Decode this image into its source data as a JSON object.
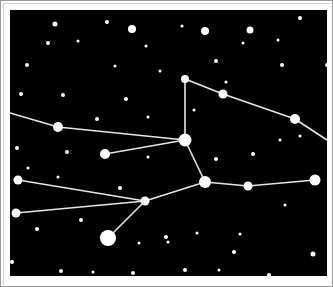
{
  "image": {
    "subject": "constellation star map",
    "background_color": "#000000",
    "frame_color": "#ffffff",
    "border_color": "#9a9a9a",
    "star_color": "#ffffff",
    "line_color": "#e6e6e6"
  },
  "constellation": {
    "stars": [
      {
        "id": "A",
        "x": 185,
        "y": 79,
        "r": 4
      },
      {
        "id": "B",
        "x": 223,
        "y": 94,
        "r": 4.5
      },
      {
        "id": "C",
        "x": 295,
        "y": 119,
        "r": 5
      },
      {
        "id": "D",
        "x": 185,
        "y": 140,
        "r": 6.5
      },
      {
        "id": "E",
        "x": 58,
        "y": 127,
        "r": 5
      },
      {
        "id": "F",
        "x": 105,
        "y": 154,
        "r": 5
      },
      {
        "id": "G",
        "x": 205,
        "y": 182,
        "r": 6
      },
      {
        "id": "H",
        "x": 248,
        "y": 186,
        "r": 4.5
      },
      {
        "id": "I",
        "x": 315,
        "y": 180,
        "r": 5.5
      },
      {
        "id": "J",
        "x": 18,
        "y": 180,
        "r": 4.5
      },
      {
        "id": "K",
        "x": 145,
        "y": 201,
        "r": 4.5
      },
      {
        "id": "L",
        "x": 16,
        "y": 213,
        "r": 4.5
      },
      {
        "id": "M",
        "x": 108,
        "y": 238,
        "r": 8
      }
    ],
    "lines": [
      [
        "edge-left-1",
        "E"
      ],
      [
        "E",
        "D"
      ],
      [
        "F",
        "D"
      ],
      [
        "D",
        "A"
      ],
      [
        "A",
        "B"
      ],
      [
        "B",
        "C"
      ],
      [
        "C",
        "edge-right-1"
      ],
      [
        "D",
        "G"
      ],
      [
        "G",
        "H"
      ],
      [
        "H",
        "I"
      ],
      [
        "J",
        "K"
      ],
      [
        "L",
        "K"
      ],
      [
        "K",
        "G"
      ],
      [
        "K",
        "M"
      ]
    ],
    "edges": {
      "edge-left-1": {
        "x": 10,
        "y": 113
      },
      "edge-right-1": {
        "x": 327,
        "y": 140
      }
    }
  },
  "background_stars": [
    {
      "x": 55,
      "y": 24,
      "r": 2.5
    },
    {
      "x": 107,
      "y": 22,
      "r": 2
    },
    {
      "x": 132,
      "y": 29,
      "r": 4
    },
    {
      "x": 48,
      "y": 43,
      "r": 2
    },
    {
      "x": 78,
      "y": 41,
      "r": 1.5
    },
    {
      "x": 146,
      "y": 46,
      "r": 1.5
    },
    {
      "x": 182,
      "y": 26,
      "r": 1.5
    },
    {
      "x": 205,
      "y": 31,
      "r": 4
    },
    {
      "x": 250,
      "y": 30,
      "r": 3.5
    },
    {
      "x": 300,
      "y": 18,
      "r": 2
    },
    {
      "x": 243,
      "y": 43,
      "r": 1.5
    },
    {
      "x": 278,
      "y": 40,
      "r": 1.5
    },
    {
      "x": 27,
      "y": 65,
      "r": 2
    },
    {
      "x": 115,
      "y": 66,
      "r": 1.5
    },
    {
      "x": 160,
      "y": 71,
      "r": 1.5
    },
    {
      "x": 216,
      "y": 61,
      "r": 2
    },
    {
      "x": 282,
      "y": 65,
      "r": 2
    },
    {
      "x": 327,
      "y": 65,
      "r": 2
    },
    {
      "x": 21,
      "y": 94,
      "r": 2
    },
    {
      "x": 63,
      "y": 95,
      "r": 2
    },
    {
      "x": 126,
      "y": 99,
      "r": 2
    },
    {
      "x": 148,
      "y": 117,
      "r": 1.5
    },
    {
      "x": 226,
      "y": 82,
      "r": 1.5
    },
    {
      "x": 194,
      "y": 110,
      "r": 1.5
    },
    {
      "x": 97,
      "y": 119,
      "r": 2
    },
    {
      "x": 17,
      "y": 148,
      "r": 2
    },
    {
      "x": 67,
      "y": 152,
      "r": 2
    },
    {
      "x": 28,
      "y": 168,
      "r": 1.5
    },
    {
      "x": 58,
      "y": 177,
      "r": 1.5
    },
    {
      "x": 148,
      "y": 157,
      "r": 1.5
    },
    {
      "x": 216,
      "y": 159,
      "r": 2
    },
    {
      "x": 253,
      "y": 154,
      "r": 2
    },
    {
      "x": 280,
      "y": 140,
      "r": 1.5
    },
    {
      "x": 300,
      "y": 136,
      "r": 1.5
    },
    {
      "x": 120,
      "y": 188,
      "r": 2
    },
    {
      "x": 285,
      "y": 205,
      "r": 1.5
    },
    {
      "x": 37,
      "y": 229,
      "r": 2
    },
    {
      "x": 81,
      "y": 220,
      "r": 2
    },
    {
      "x": 166,
      "y": 237,
      "r": 2
    },
    {
      "x": 197,
      "y": 233,
      "r": 1.5
    },
    {
      "x": 240,
      "y": 234,
      "r": 1.5
    },
    {
      "x": 139,
      "y": 243,
      "r": 1.5
    },
    {
      "x": 234,
      "y": 252,
      "r": 2
    },
    {
      "x": 313,
      "y": 254,
      "r": 2.5
    },
    {
      "x": 12,
      "y": 262,
      "r": 2
    },
    {
      "x": 61,
      "y": 271,
      "r": 2
    },
    {
      "x": 93,
      "y": 272,
      "r": 1.5
    },
    {
      "x": 133,
      "y": 273,
      "r": 2
    },
    {
      "x": 185,
      "y": 270,
      "r": 2
    },
    {
      "x": 219,
      "y": 270,
      "r": 1.5
    },
    {
      "x": 269,
      "y": 275,
      "r": 2
    },
    {
      "x": 168,
      "y": 242,
      "r": 1.5
    },
    {
      "x": 330,
      "y": 238,
      "r": 1.5
    }
  ]
}
